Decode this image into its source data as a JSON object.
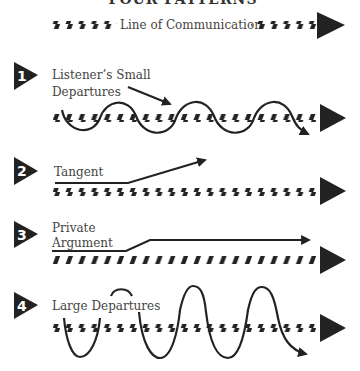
{
  "title": "FOUR PATTERNS",
  "legend": {
    "label": "Line of Communication"
  },
  "patterns": [
    {
      "number": "1",
      "label_lines": [
        "Listener’s Small",
        "Departures"
      ]
    },
    {
      "number": "2",
      "label_lines": [
        "Tangent"
      ]
    },
    {
      "number": "3",
      "label_lines": [
        "Private",
        "Argument"
      ]
    },
    {
      "number": "4",
      "label_lines": [
        "Large Departures"
      ]
    }
  ],
  "colors": {
    "ink": "#222222",
    "text": "#444444",
    "background": "#ffffff"
  }
}
